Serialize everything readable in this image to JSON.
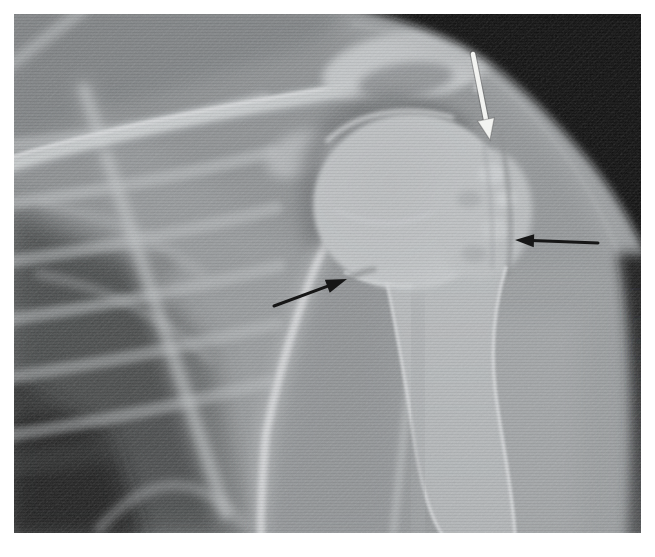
{
  "page": {
    "width": 655,
    "height": 557,
    "background": "#ffffff"
  },
  "figure": {
    "film": {
      "left": 14,
      "top": 14,
      "width": 627,
      "height": 519,
      "base_color": "#919496",
      "dark_background_color": "#0b0b0b"
    }
  },
  "annotations": {
    "arrows": [
      {
        "id": "white-arrow",
        "color": "#f2f3f1",
        "outline": "rgba(70,70,70,0.35)",
        "direction": "down",
        "from": {
          "x": 459,
          "y": 40
        },
        "to": {
          "x": 476,
          "y": 126
        },
        "shaft_width": 4.5,
        "head_length": 21,
        "head_half_width": 8.5
      },
      {
        "id": "black-arrow-right",
        "color": "#161616",
        "outline": null,
        "direction": "left",
        "from": {
          "x": 584,
          "y": 229
        },
        "to": {
          "x": 501,
          "y": 226
        },
        "shaft_width": 3,
        "head_length": 19,
        "head_half_width": 6.5
      },
      {
        "id": "black-arrow-lower-left",
        "color": "#161616",
        "outline": null,
        "direction": "up-right",
        "from": {
          "x": 260,
          "y": 292
        },
        "to": {
          "x": 333,
          "y": 265
        },
        "shaft_width": 3,
        "head_length": 21,
        "head_half_width": 7
      }
    ]
  }
}
